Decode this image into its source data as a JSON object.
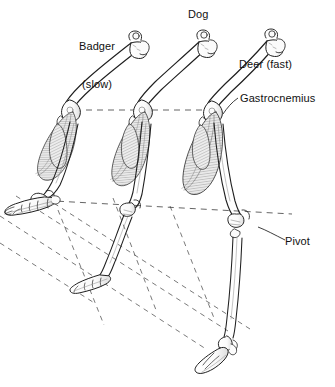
{
  "figure": {
    "background_color": "#ffffff",
    "ink_color": "#1a1a1a",
    "muscle_shade": "#8d8d8d",
    "bone_fill": "#fbfbfb",
    "dashed_color": "#4a4a4a"
  },
  "labels": {
    "badger_line1": "Badger",
    "badger_line2": "(slow)",
    "dog": "Dog",
    "deer": "Deer (fast)",
    "gastrocnemius": "Gastrocnemius",
    "pivot": "Pivot"
  },
  "specimens": [
    {
      "name": "Badger",
      "speed": "slow",
      "foot_posture": "plantigrade",
      "label": "Badger\n(slow)"
    },
    {
      "name": "Dog",
      "speed": "",
      "foot_posture": "digitigrade",
      "label": "Dog"
    },
    {
      "name": "Deer",
      "speed": "fast",
      "foot_posture": "unguligrade",
      "label": "Deer (fast)"
    }
  ],
  "annotations": [
    {
      "id": "gastrocnemius",
      "text": "Gastrocnemius",
      "target": "calf muscle of the deer limb"
    },
    {
      "id": "pivot",
      "text": "Pivot",
      "target": "hock joint of the deer limb"
    }
  ],
  "construction_lines": {
    "knee_level_dashed": true,
    "hock_level_dashed": true,
    "ground_plane_dashed": true
  }
}
